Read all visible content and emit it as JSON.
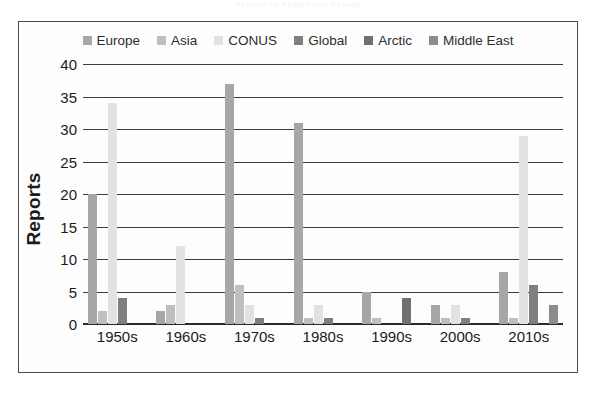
{
  "figure": {
    "faint_title": "Reports by Region and Decade",
    "y_axis_title": "Reports"
  },
  "chart_data": {
    "type": "bar",
    "title": "",
    "xlabel": "",
    "ylabel": "Reports",
    "ylim": [
      0,
      40
    ],
    "ytick_step": 5,
    "yticks": [
      "40",
      "35",
      "30",
      "25",
      "20",
      "15",
      "10",
      "5",
      "0"
    ],
    "grid": true,
    "legend_position": "top-center",
    "categories": [
      "1950s",
      "1960s",
      "1970s",
      "1980s",
      "1990s",
      "2000s",
      "2010s"
    ],
    "series": [
      {
        "name": "Europe",
        "color": "#a6a6a6",
        "values": [
          20,
          2,
          37,
          31,
          5,
          3,
          8
        ]
      },
      {
        "name": "Asia",
        "color": "#bfbfbf",
        "values": [
          2,
          3,
          6,
          1,
          1,
          1,
          1
        ]
      },
      {
        "name": "CONUS",
        "color": "#e2e2e2",
        "values": [
          34,
          12,
          3,
          3,
          0,
          3,
          29
        ]
      },
      {
        "name": "Global",
        "color": "#7f7f7f",
        "values": [
          4,
          0,
          1,
          1,
          0,
          1,
          6
        ]
      },
      {
        "name": "Arctic",
        "color": "#707070",
        "values": [
          0,
          0,
          0,
          0,
          4,
          0,
          0
        ]
      },
      {
        "name": "Middle East",
        "color": "#8c8c8c",
        "values": [
          0,
          0,
          0,
          0,
          0,
          0,
          3
        ]
      }
    ]
  }
}
